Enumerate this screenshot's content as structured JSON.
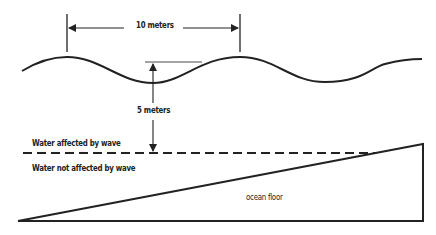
{
  "diagram": {
    "labels": {
      "wavelength": "10 meters",
      "wave_base_depth": "5 meters",
      "affected": "Water affected by wave",
      "not_affected": "Water not affected by wave",
      "floor": "ocean floor"
    },
    "colors": {
      "line": "#222222",
      "background": "#ffffff"
    }
  }
}
